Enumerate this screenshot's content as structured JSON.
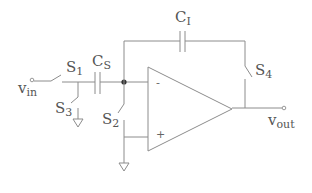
{
  "diagram": {
    "type": "switched-capacitor integrator circuit",
    "colors": {
      "wire": "#8c8c8c",
      "text": "#555555",
      "junction": "#333333",
      "background": "#ffffff"
    },
    "labels": {
      "vin": {
        "main": "v",
        "sub": "in"
      },
      "vout": {
        "main": "v",
        "sub": "out"
      },
      "s1": {
        "main": "S",
        "sub": "1"
      },
      "s2": {
        "main": "S",
        "sub": "2"
      },
      "s3": {
        "main": "S",
        "sub": "3"
      },
      "s4": {
        "main": "S",
        "sub": "4"
      },
      "cs": {
        "main": "C",
        "sub": "S"
      },
      "ci": {
        "main": "C",
        "sub": "I"
      }
    },
    "opamp": {
      "inverting": "-",
      "noninverting": "+"
    },
    "components": [
      {
        "id": "S1",
        "kind": "switch",
        "from": "vin",
        "to": "node-a"
      },
      {
        "id": "S3",
        "kind": "switch",
        "from": "node-a",
        "to": "ground"
      },
      {
        "id": "CS",
        "kind": "capacitor",
        "from": "node-a",
        "to": "node-b"
      },
      {
        "id": "S2",
        "kind": "switch",
        "from": "node-b",
        "to": "ground"
      },
      {
        "id": "CI",
        "kind": "capacitor",
        "from": "node-b",
        "to": "node-c"
      },
      {
        "id": "S4",
        "kind": "switch",
        "from": "node-c",
        "to": "vout"
      },
      {
        "id": "opamp",
        "kind": "op-amp",
        "inverting": "node-b",
        "noninverting": "ground",
        "output": "vout"
      }
    ]
  }
}
